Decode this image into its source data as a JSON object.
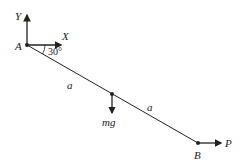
{
  "diagram": {
    "labels": {
      "y_axis": "Y",
      "x_axis": "X",
      "point_a": "A",
      "point_b": "B",
      "angle": "30°",
      "segment_1": "a",
      "segment_2": "a",
      "weight": "mg",
      "force": "P"
    },
    "colors": {
      "line": "#222222"
    }
  }
}
